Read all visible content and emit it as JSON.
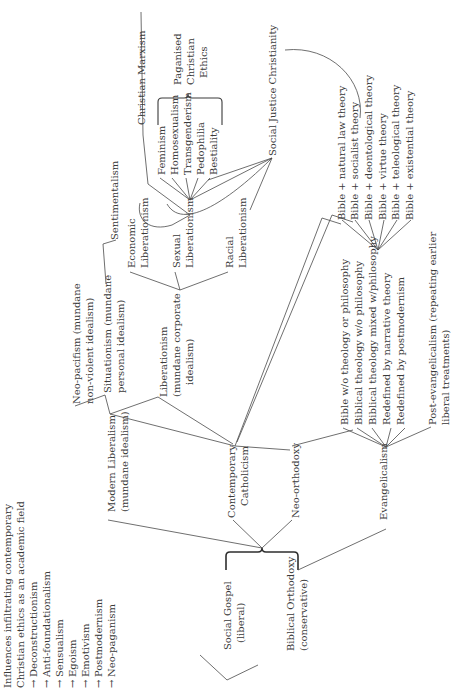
{
  "diagram": {
    "orientation": "rotated 90° counter-clockwise (text reads bottom-to-top)",
    "influences": {
      "heading_line1": "Influences infiltrating contemporary",
      "heading_line2": "Christian ethics as an academic field",
      "arrow": "→",
      "items": [
        "Deconstructionism",
        "Anti-foundationalism",
        "Sensualism",
        "Egoism",
        "Emotivism",
        "Postmodernism",
        "Neo-paganism"
      ]
    },
    "root": {
      "social_gospel_line1": "Social Gospel",
      "social_gospel_line2": "(liberal)",
      "biblical_orthodoxy_line1": "Biblical Orthodoxy",
      "biblical_orthodoxy_line2": "(conservative)"
    },
    "liberal_branch": {
      "modern_liberalism_line1": "Modern Liberalism",
      "modern_liberalism_line2": "(mundane idealism)",
      "contemporary_catholicism_line1": "Contemporary",
      "contemporary_catholicism_line2": "Catholicism",
      "neo_orthodoxy": "Neo-orthodoxy"
    },
    "idealisms": {
      "neo_pacifism_line1": "Neo-pacifism  (mundane",
      "neo_pacifism_line2": "non-violent idealism)",
      "situationism_line1": "Situationism  (mundane",
      "situationism_line2": "personal idealism)",
      "sentimentalism": "Sentimentalism",
      "liberationism_line1": "Liberationism",
      "liberationism_line2": "(mundane corporate",
      "liberationism_line3": "idealism)"
    },
    "liberationisms": {
      "economic_line1": "Economic",
      "economic_line2": "Liberationism",
      "sexual_line1": "Sexual",
      "sexual_line2": "Liberationism",
      "racial_line1": "Racial",
      "racial_line2": "Liberationism",
      "christian_marxism": "Christian Marxism",
      "social_justice_christianity": "Social Justice Christianity"
    },
    "paganised": {
      "items": [
        "Feminism",
        "Homosexualism",
        "Transgenderism",
        "Pedophilia",
        "Bestiality"
      ],
      "label_line1": "Paganised",
      "label_line2": "Christian",
      "label_line3": "Ethics"
    },
    "evangelical_branch": {
      "evangelicalism": "Evangelicalism",
      "items": [
        "Bible w/o theology or philosophy",
        "Biblical theology w/o philosophy",
        "Biblical theology mixed w/philosophy",
        "Redefined by narrative theory",
        "Redefined by postmodernism"
      ],
      "post_evangelicalism_line1": "Post-evangelicalism (repeating earlier",
      "post_evangelicalism_line2": "liberal treatments)"
    },
    "philosophy_mixes": {
      "items": [
        "Bible + natural law theory",
        "Bible + socialist theory",
        "Bible + deontological theory",
        "Bible + virtue theory",
        "Bible + teleological theory",
        "Bible + existential theory"
      ]
    }
  }
}
